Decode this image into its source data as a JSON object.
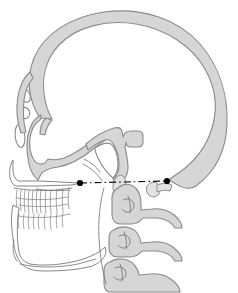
{
  "figure": {
    "background_color": "#ffffff",
    "width": 238,
    "height": 293
  },
  "style": {
    "bone_fill": "#d6d6d6",
    "bone_fill_light": "#e2e2e2",
    "bone_stroke": "#8a8a8a",
    "thin_stroke": "#6f6f6f",
    "outline_stroke": "#707070",
    "landmark_color": "#000000",
    "plane_color": "#111111"
  },
  "reference_plane": {
    "name": "frankfort-horizontal-plane",
    "line_style": "dash-dot",
    "start": {
      "x": 80,
      "y": 183
    },
    "end": {
      "x": 167,
      "y": 181
    },
    "landmarks": [
      {
        "name": "orbitale",
        "x": 80,
        "y": 183,
        "radius": 3.1
      },
      {
        "name": "porion",
        "x": 167,
        "y": 181,
        "radius": 3.1
      }
    ]
  },
  "structures": [
    {
      "name": "cranial-vault",
      "fill": "#d6d6d6"
    },
    {
      "name": "frontal-bone",
      "fill": "#d6d6d6"
    },
    {
      "name": "ethmoid-orbital-cavities",
      "fill": "#ffffff"
    },
    {
      "name": "sphenoid-sella-region",
      "fill": "#d6d6d6"
    },
    {
      "name": "pterygomaxillary-fissure",
      "fill": "#ffffff"
    },
    {
      "name": "maxilla",
      "fill": "#ffffff"
    },
    {
      "name": "mandible",
      "fill": "#ffffff"
    },
    {
      "name": "upper-dentition",
      "fill": "#ffffff"
    },
    {
      "name": "lower-dentition",
      "fill": "#ffffff"
    },
    {
      "name": "mastoid-styloid-process",
      "fill": "#d6d6d6"
    },
    {
      "name": "occipital-bone",
      "fill": "#d6d6d6"
    },
    {
      "name": "cervical-vertebra-c1-c2",
      "fill": "#d6d6d6"
    },
    {
      "name": "cervical-vertebra-c3",
      "fill": "#d6d6d6"
    },
    {
      "name": "cervical-vertebra-c4",
      "fill": "#d6d6d6"
    }
  ]
}
